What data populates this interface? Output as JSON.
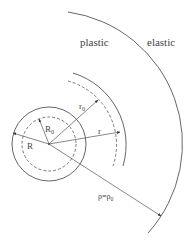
{
  "diagram": {
    "regions": {
      "plastic": "plastic",
      "elastic": "elastic"
    },
    "labels": {
      "R": "R",
      "R0": "R",
      "R0_sub": "0",
      "r0": "r",
      "r0_sub": "0",
      "r": "r",
      "rho": "ρ=ρ",
      "rho_sub": "0"
    },
    "colors": {
      "line": "#555555",
      "text": "#444444"
    }
  }
}
